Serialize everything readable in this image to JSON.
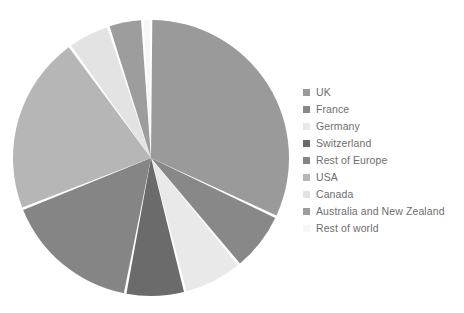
{
  "chart_data": {
    "type": "pie",
    "title": "",
    "subtitle": "",
    "xlabel": "",
    "ylabel": "",
    "grid": false,
    "legend_position": "right",
    "start_angle_deg": 0,
    "direction": "clockwise",
    "categories": [
      "UK",
      "France",
      "Germany",
      "Switzerland",
      "Rest of Europe",
      "USA",
      "Canada",
      "Australia and New Zealand",
      "Rest of world"
    ],
    "values": [
      32,
      7,
      7,
      7,
      16,
      21,
      5,
      4,
      1
    ],
    "colors": [
      "#9a9a9a",
      "#888888",
      "#e9e9e9",
      "#6b6b6b",
      "#858585",
      "#b6b6b6",
      "#e3e3e3",
      "#9d9d9d",
      "#f7f7f7"
    ],
    "slices": [
      {
        "label": "UK",
        "value": 32,
        "color": "#9a9a9a",
        "start_deg": 0,
        "end_deg": 115.2
      },
      {
        "label": "France",
        "value": 7,
        "color": "#888888",
        "start_deg": 115.2,
        "end_deg": 140.4
      },
      {
        "label": "Germany",
        "value": 7,
        "color": "#e9e9e9",
        "start_deg": 140.4,
        "end_deg": 165.6
      },
      {
        "label": "Switzerland",
        "value": 7,
        "color": "#6b6b6b",
        "start_deg": 165.6,
        "end_deg": 190.8
      },
      {
        "label": "Rest of Europe",
        "value": 16,
        "color": "#858585",
        "start_deg": 190.8,
        "end_deg": 248.4
      },
      {
        "label": "USA",
        "value": 21,
        "color": "#b6b6b6",
        "start_deg": 248.4,
        "end_deg": 324.0
      },
      {
        "label": "Canada",
        "value": 5,
        "color": "#e3e3e3",
        "start_deg": 324.0,
        "end_deg": 342.0
      },
      {
        "label": "Australia and New Zealand",
        "value": 4,
        "color": "#9d9d9d",
        "start_deg": 342.0,
        "end_deg": 356.4
      },
      {
        "label": "Rest of world",
        "value": 1,
        "color": "#f7f7f7",
        "start_deg": 356.4,
        "end_deg": 360.0
      }
    ],
    "geometry": {
      "center_x": 151,
      "center_y": 158,
      "radius": 138
    }
  },
  "legend": {
    "items": [
      {
        "label": "UK",
        "color": "#9a9a9a"
      },
      {
        "label": "France",
        "color": "#888888"
      },
      {
        "label": "Germany",
        "color": "#e9e9e9"
      },
      {
        "label": "Switzerland",
        "color": "#6b6b6b"
      },
      {
        "label": "Rest of Europe",
        "color": "#858585"
      },
      {
        "label": "USA",
        "color": "#b6b6b6"
      },
      {
        "label": "Canada",
        "color": "#e3e3e3"
      },
      {
        "label": "Australia and New Zealand",
        "color": "#9d9d9d"
      },
      {
        "label": "Rest of world",
        "color": "#f7f7f7"
      }
    ]
  }
}
